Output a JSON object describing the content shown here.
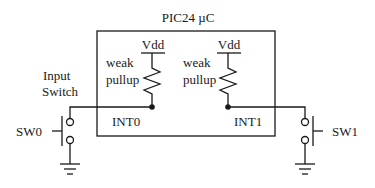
{
  "diagram": {
    "title": "PIC24 µC",
    "left": {
      "supply": "Vdd",
      "resistor_label_1": "weak",
      "resistor_label_2": "pullup",
      "pin": "INT0",
      "switch": "SW0",
      "switch_caption_1": "Input",
      "switch_caption_2": "Switch"
    },
    "right": {
      "supply": "Vdd",
      "resistor_label_1": "weak",
      "resistor_label_2": "pullup",
      "pin": "INT1",
      "switch": "SW1"
    }
  }
}
